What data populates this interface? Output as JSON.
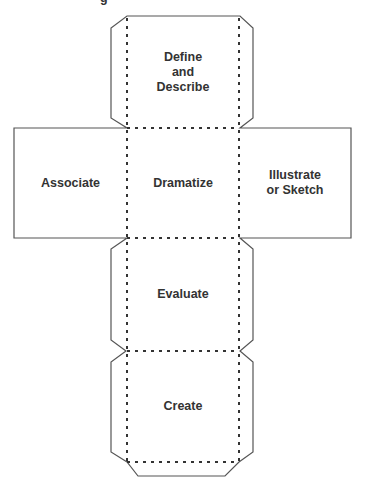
{
  "diagram": {
    "type": "cube-net",
    "title_fragment": "g",
    "faces": {
      "top": {
        "label": "Define\nand\nDescribe"
      },
      "left": {
        "label": "Associate"
      },
      "center": {
        "label": "Dramatize"
      },
      "right": {
        "label": "Illustrate\nor Sketch"
      },
      "lower": {
        "label": "Evaluate"
      },
      "bottom": {
        "label": "Create"
      }
    },
    "colors": {
      "cut_line": "#555555",
      "fold_line": "#333333",
      "text": "#333333",
      "background": "#ffffff"
    },
    "legend": {
      "solid_line": "cut",
      "dotted_line": "fold"
    }
  }
}
